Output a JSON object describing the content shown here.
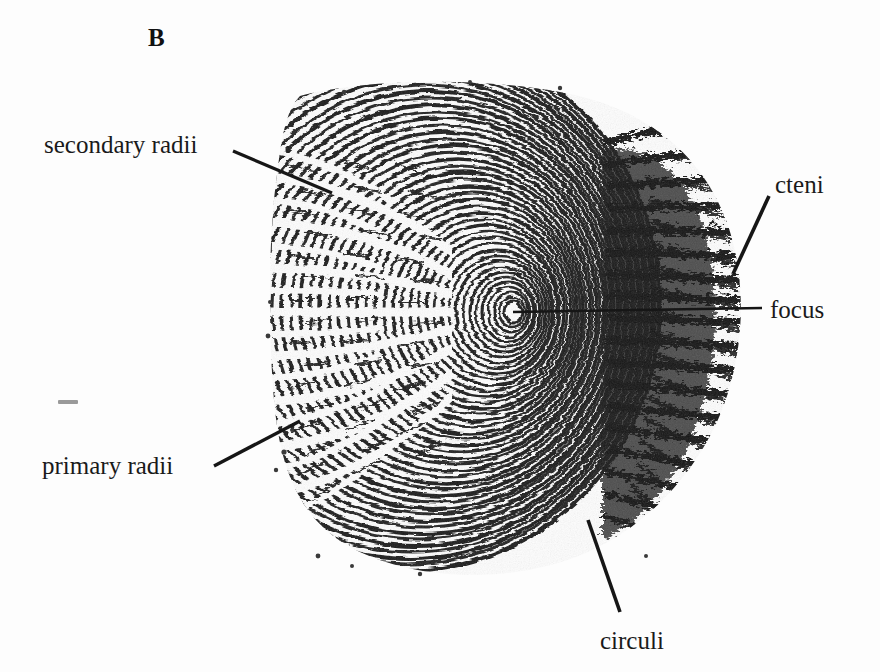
{
  "figure": {
    "panel_letter": "B",
    "background_color": "#fdfdfd",
    "ink_color": "#161616"
  },
  "annotations": [
    {
      "id": "secondary-radii",
      "label": "secondary radii",
      "text_x": 44,
      "text_y": 152,
      "anchor": "start",
      "leader": {
        "x1": 233,
        "y1": 151,
        "x2": 332,
        "y2": 193,
        "width": 3.2
      }
    },
    {
      "id": "primary-radii",
      "label": "primary radii",
      "text_x": 42,
      "text_y": 473,
      "anchor": "start",
      "leader": {
        "x1": 214,
        "y1": 466,
        "x2": 300,
        "y2": 421,
        "width": 3.4
      }
    },
    {
      "id": "cteni",
      "label": "cteni",
      "text_x": 775,
      "text_y": 192,
      "anchor": "start",
      "leader": {
        "x1": 769,
        "y1": 196,
        "x2": 733,
        "y2": 274,
        "width": 3.6
      }
    },
    {
      "id": "focus",
      "label": "focus",
      "text_x": 770,
      "text_y": 317,
      "anchor": "start",
      "leader": {
        "x1": 513,
        "y1": 312,
        "x2": 762,
        "y2": 308,
        "width": 2.6
      }
    },
    {
      "id": "circuli",
      "label": "circuli",
      "text_x": 600,
      "text_y": 648,
      "anchor": "start",
      "leader": {
        "x1": 588,
        "y1": 520,
        "x2": 620,
        "y2": 612,
        "width": 3.6
      }
    }
  ],
  "ink_marks": [
    {
      "id": "stray-dash",
      "x": 58,
      "y": 400,
      "w": 20,
      "h": 4
    }
  ],
  "chart_data": {
    "type": "diagram",
    "structures": [
      {
        "name": "focus",
        "description": "nucleus / origin of growth at centre of concentric rings",
        "center_x": 513,
        "center_y": 312
      },
      {
        "name": "circuli",
        "description": "concentric growth rings around the focus",
        "ring_count": 34
      },
      {
        "name": "primary radii",
        "description": "deep grooves radiating from focus across the anterior field"
      },
      {
        "name": "secondary radii",
        "description": "shorter grooves not reaching the focus, in the anterior field"
      },
      {
        "name": "cteni",
        "description": "spiny projections along the posterior margin"
      }
    ],
    "scale_bounds": {
      "left": 272,
      "top": 84,
      "right": 742,
      "bottom": 568
    }
  }
}
